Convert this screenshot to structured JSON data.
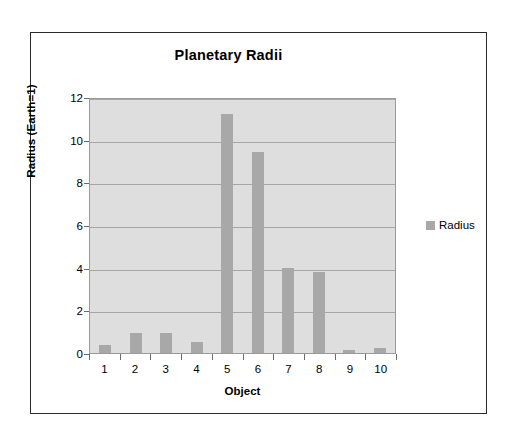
{
  "chart_data": {
    "type": "bar",
    "title": "Planetary Radii",
    "xlabel": "Object",
    "ylabel": "Radius (Earth=1)",
    "categories": [
      "1",
      "2",
      "3",
      "4",
      "5",
      "6",
      "7",
      "8",
      "9",
      "10"
    ],
    "values": [
      0.38,
      0.95,
      0.95,
      0.53,
      11.2,
      9.4,
      4.0,
      3.8,
      0.15,
      0.25
    ],
    "series": [
      {
        "name": "Radius",
        "values": [
          0.38,
          0.95,
          0.95,
          0.53,
          11.2,
          9.4,
          4.0,
          3.8,
          0.15,
          0.25
        ]
      }
    ],
    "ylim": [
      0,
      12
    ],
    "yticks": [
      0,
      2,
      4,
      6,
      8,
      10,
      12
    ],
    "ytick_labels": [
      "0",
      "2",
      "4",
      "6",
      "8",
      "10",
      "12"
    ],
    "grid": "horizontal",
    "legend": {
      "position": "right",
      "entries": [
        "Radius"
      ]
    },
    "colors": {
      "bar": "#a8a8a8",
      "plot_background": "#dedede",
      "gridline": "#a6a6a6",
      "frame": "#2b2b2b"
    }
  }
}
